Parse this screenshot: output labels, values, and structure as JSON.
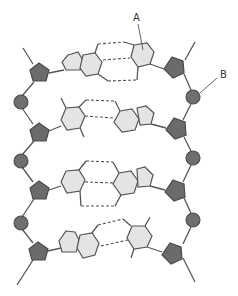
{
  "diagram": {
    "labels": [
      {
        "id": "A",
        "text": "A",
        "points_to": "nitrogenous base"
      },
      {
        "id": "B",
        "text": "B",
        "points_to": "phosphate group"
      }
    ],
    "strands": {
      "left": {
        "sugars": 4,
        "phosphates": 3
      },
      "right": {
        "sugars": 4,
        "phosphates": 3
      }
    },
    "base_pairs": [
      {
        "row": 1,
        "left_base": "purine (double ring)",
        "right_base": "pyrimidine (single ring)",
        "hydrogen_bonds": 3
      },
      {
        "row": 2,
        "left_base": "pyrimidine (single ring)",
        "right_base": "purine (double ring)",
        "hydrogen_bonds": 2
      },
      {
        "row": 3,
        "left_base": "pyrimidine (single ring)",
        "right_base": "purine (double ring)",
        "hydrogen_bonds": 3
      },
      {
        "row": 4,
        "left_base": "purine (double ring)",
        "right_base": "pyrimidine (single ring)",
        "hydrogen_bonds": 2
      }
    ],
    "colors": {
      "sugar": "#6b6b6b",
      "phosphate": "#6f6f6f",
      "base": "#e4e4e4",
      "line": "#555555"
    }
  }
}
